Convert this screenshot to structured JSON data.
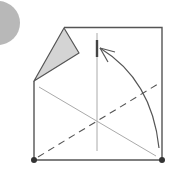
{
  "diagram": {
    "type": "origami-fold-step",
    "step_marker": {
      "shape": "circle",
      "color": "#b8b8b8",
      "label": ""
    },
    "square": {
      "color": "#555555",
      "top_left_folded": true
    },
    "flap": {
      "fill": "#d4d4d4",
      "stroke": "#555555"
    },
    "crease_lines": {
      "vertical_guide": {
        "style": "solid-thin",
        "color": "#aaaaaa"
      },
      "diagonal_solid": {
        "style": "solid-thin",
        "color": "#aaaaaa"
      },
      "diagonal_dashed": {
        "style": "valley-fold-dashed",
        "color": "#555555"
      }
    },
    "reference_mark": {
      "color": "#444444"
    },
    "arrow": {
      "direction": "fold-up-left",
      "color": "#555555"
    },
    "corner_dots": {
      "color": "#333333",
      "count": 2
    }
  }
}
